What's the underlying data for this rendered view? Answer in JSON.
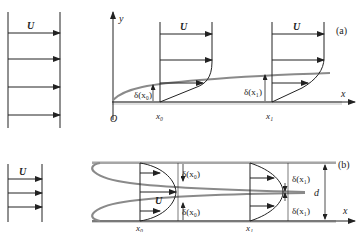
{
  "figure": {
    "panel_a": {
      "label": "(a)",
      "free_stream_label": "U",
      "axis_x": "x",
      "axis_y": "y",
      "origin": "O",
      "station_0": "x₀",
      "station_1": "x₁",
      "delta_0": "δ(x₀)",
      "delta_1": "δ(x₁)",
      "profile_0_label": "U",
      "profile_1_label": "U"
    },
    "panel_b": {
      "label": "(b)",
      "free_stream_label": "U",
      "axis_x": "x",
      "station_0": "x₀",
      "station_1": "x₁",
      "delta_0_top": "δ(x₀)",
      "delta_0_bottom": "δ(x₀)",
      "delta_1_top": "δ(x₁)",
      "delta_1_bottom": "δ(x₁)",
      "core_label": "U",
      "channel_height": "d"
    },
    "colors": {
      "line": "#222222",
      "boundary_layer": "#8a8a8a",
      "wall": "#b0b0b0"
    }
  }
}
